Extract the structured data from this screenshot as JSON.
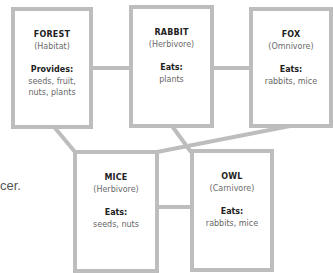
{
  "diagram": {
    "type": "food-web",
    "colors": {
      "border": "#bdbdbd",
      "connector": "#bdbdbd",
      "title": "#222222",
      "text": "#666666"
    },
    "nodes": [
      {
        "id": "forest",
        "title": "FOREST",
        "role": "(Habitat)",
        "label": "Provides:",
        "value_lines": [
          "seeds, fruit,",
          "nuts, plants"
        ]
      },
      {
        "id": "rabbit",
        "title": "RABBIT",
        "role": "(Herbivore)",
        "label": "Eats:",
        "value_lines": [
          "plants"
        ]
      },
      {
        "id": "fox",
        "title": "FOX",
        "role": "(Omnivore)",
        "label": "Eats:",
        "value_lines": [
          "rabbits, mice"
        ]
      },
      {
        "id": "mice",
        "title": "MICE",
        "role": "(Herbivore)",
        "label": "Eats:",
        "value_lines": [
          "seeds, nuts"
        ]
      },
      {
        "id": "owl",
        "title": "OWL",
        "role": "(Carnivore)",
        "label": "Eats:",
        "value_lines": [
          "rabbits, mice"
        ]
      }
    ],
    "edges": [
      {
        "from": "forest",
        "to": "rabbit"
      },
      {
        "from": "rabbit",
        "to": "fox"
      },
      {
        "from": "forest",
        "to": "mice"
      },
      {
        "from": "rabbit",
        "to": "owl"
      },
      {
        "from": "fox",
        "to": "mice"
      },
      {
        "from": "mice",
        "to": "owl"
      }
    ]
  },
  "side_text": "cer."
}
